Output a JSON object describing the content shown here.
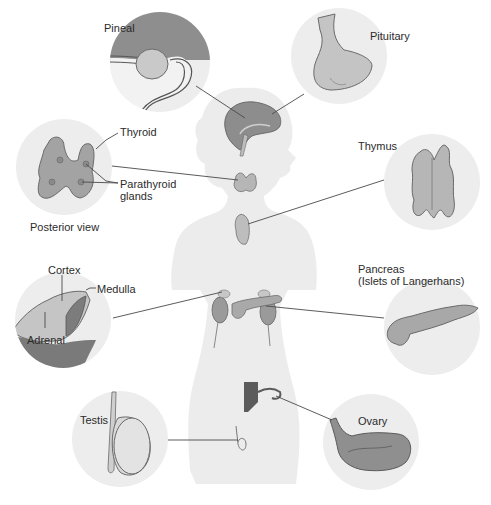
{
  "diagram": {
    "type": "anatomical-illustration",
    "colors": {
      "background": "#ffffff",
      "silhouette": "#ececec",
      "inset_circle": "#ededed",
      "organ_fill": "#a9a9a9",
      "organ_dark": "#6f6f6f",
      "organ_light": "#d2d2d2",
      "leader_line": "#4a4a4a",
      "text": "#2b2b2b"
    },
    "labels": {
      "pineal": "Pineal",
      "pituitary": "Pituitary",
      "thyroid": "Thyroid",
      "parathyroid_1": "Parathyroid",
      "parathyroid_2": "glands",
      "posterior_view": "Posterior view",
      "thymus": "Thymus",
      "cortex": "Cortex",
      "medulla": "Medulla",
      "adrenal": "Adrenal",
      "pancreas_1": "Pancreas",
      "pancreas_2": "(Islets of Langerhans)",
      "testis": "Testis",
      "ovary": "Ovary"
    },
    "insets": [
      {
        "name": "pineal",
        "cx": 160,
        "cy": 62,
        "r": 50
      },
      {
        "name": "pituitary",
        "cx": 339,
        "cy": 56,
        "r": 48
      },
      {
        "name": "thyroid-parathyroid",
        "cx": 64,
        "cy": 167,
        "r": 48
      },
      {
        "name": "thymus",
        "cx": 432,
        "cy": 182,
        "r": 48
      },
      {
        "name": "adrenal",
        "cx": 63,
        "cy": 320,
        "r": 48
      },
      {
        "name": "pancreas",
        "cx": 432,
        "cy": 327,
        "r": 48
      },
      {
        "name": "testis",
        "cx": 120,
        "cy": 439,
        "r": 48
      },
      {
        "name": "ovary",
        "cx": 371,
        "cy": 442,
        "r": 48
      }
    ]
  }
}
